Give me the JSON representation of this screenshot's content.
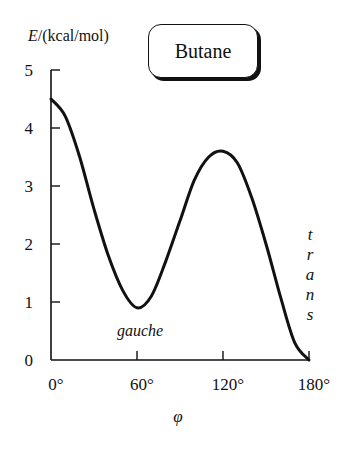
{
  "chart_data": {
    "type": "line",
    "title": "Butane",
    "ylabel_var": "E",
    "ylabel_unit": "/(kcal/mol)",
    "xlabel": "φ",
    "xlim": [
      0,
      180
    ],
    "ylim": [
      0,
      5
    ],
    "grid": false,
    "legend": null,
    "x_ticks": [
      0,
      60,
      120,
      180
    ],
    "x_tick_labels": [
      "0°",
      "60°",
      "120°",
      "180°"
    ],
    "y_ticks": [
      0,
      1,
      2,
      3,
      4,
      5
    ],
    "y_tick_labels": [
      "0",
      "1",
      "2",
      "3",
      "4",
      "5"
    ],
    "series": [
      {
        "name": "Butane torsional energy",
        "x": [
          0,
          10,
          20,
          30,
          40,
          50,
          60,
          70,
          80,
          90,
          100,
          110,
          120,
          130,
          140,
          150,
          160,
          170,
          180
        ],
        "values": [
          4.5,
          4.2,
          3.5,
          2.6,
          1.8,
          1.2,
          0.9,
          1.1,
          1.7,
          2.4,
          3.1,
          3.5,
          3.6,
          3.4,
          2.8,
          2.0,
          1.1,
          0.3,
          0.0
        ]
      }
    ],
    "annotations": [
      {
        "text": "gauche",
        "x": 60,
        "y": 0.55,
        "style": "italic"
      },
      {
        "text": "trans",
        "x": 180,
        "y": 1.9,
        "style": "italic",
        "orientation": "vertical-stacked"
      }
    ]
  }
}
